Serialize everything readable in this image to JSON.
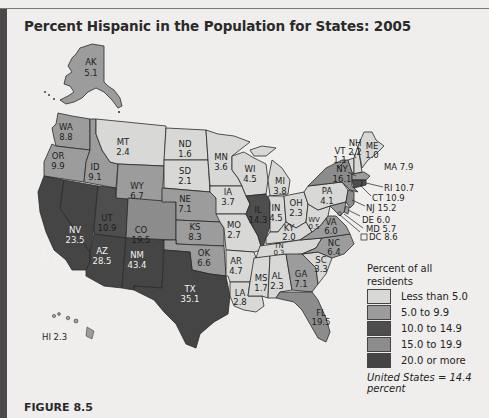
{
  "title": "Percent Hispanic in the Population for States: 2005",
  "figure_label": "FIGURE 8.5",
  "legend": {
    "title": "Percent of all residents",
    "items": [
      {
        "label": "Less than 5.0",
        "color": "#d8d8d6"
      },
      {
        "label": "5.0 to 9.9",
        "color": "#9c9c9c"
      },
      {
        "label": "10.0 to 14.9",
        "color": "#4e4e4e"
      },
      {
        "label": "15.0 to 19.9",
        "color": "#8c8c8c"
      },
      {
        "label": "20.0 or more",
        "color": "#454545"
      }
    ]
  },
  "us_note": "United States = 14.4 percent",
  "states": {
    "AK": {
      "abbr": "AK",
      "value": "5.1"
    },
    "HI": {
      "abbr": "HI",
      "value": "2.3",
      "label": "HI 2.3"
    },
    "WA": {
      "abbr": "WA",
      "value": "8.8"
    },
    "OR": {
      "abbr": "OR",
      "value": "9.9"
    },
    "CA": {
      "abbr": "CA",
      "value": "35.2"
    },
    "ID": {
      "abbr": "ID",
      "value": "9.1"
    },
    "NV": {
      "abbr": "NV",
      "value": "23.5"
    },
    "UT": {
      "abbr": "UT",
      "value": "10.9"
    },
    "AZ": {
      "abbr": "AZ",
      "value": "28.5"
    },
    "MT": {
      "abbr": "MT",
      "value": "2.4"
    },
    "WY": {
      "abbr": "WY",
      "value": "6.7"
    },
    "CO": {
      "abbr": "CO",
      "value": "19.5"
    },
    "NM": {
      "abbr": "NM",
      "value": "43.4"
    },
    "ND": {
      "abbr": "ND",
      "value": "1.6"
    },
    "SD": {
      "abbr": "SD",
      "value": "2.1"
    },
    "NE": {
      "abbr": "NE",
      "value": "7.1"
    },
    "KS": {
      "abbr": "KS",
      "value": "8.3"
    },
    "OK": {
      "abbr": "OK",
      "value": "6.6"
    },
    "TX": {
      "abbr": "TX",
      "value": "35.1"
    },
    "MN": {
      "abbr": "MN",
      "value": "3.6"
    },
    "IA": {
      "abbr": "IA",
      "value": "3.7"
    },
    "MO": {
      "abbr": "MO",
      "value": "2.7"
    },
    "AR": {
      "abbr": "AR",
      "value": "4.7"
    },
    "LA": {
      "abbr": "LA",
      "value": "2.8"
    },
    "WI": {
      "abbr": "WI",
      "value": "4.5"
    },
    "IL": {
      "abbr": "IL",
      "value": "14.3"
    },
    "MI": {
      "abbr": "MI",
      "value": "3.8"
    },
    "IN": {
      "abbr": "IN",
      "value": "4.5"
    },
    "OH": {
      "abbr": "OH",
      "value": "2.3"
    },
    "KY": {
      "abbr": "KY",
      "value": "2.0"
    },
    "TN": {
      "abbr": "TN",
      "value": "0.3"
    },
    "MS": {
      "abbr": "MS",
      "value": "1.7"
    },
    "AL": {
      "abbr": "AL",
      "value": "2.3"
    },
    "GA": {
      "abbr": "GA",
      "value": "7.1"
    },
    "FL": {
      "abbr": "FL",
      "value": "19.5"
    },
    "SC": {
      "abbr": "SC",
      "value": "3.3"
    },
    "NC": {
      "abbr": "NC",
      "value": "6.4"
    },
    "VA": {
      "abbr": "VA",
      "value": "6.0"
    },
    "WV": {
      "abbr": "WV",
      "value": "0.5"
    },
    "PA": {
      "abbr": "PA",
      "value": "4.1"
    },
    "NY": {
      "abbr": "NY",
      "value": "16.1"
    },
    "VT": {
      "abbr": "VT",
      "value": "1.1"
    },
    "NH": {
      "abbr": "NH",
      "value": "2.2"
    },
    "ME": {
      "abbr": "ME",
      "value": "1.0"
    },
    "MA": {
      "abbr": "MA",
      "value": "7.9",
      "label": "MA 7.9"
    },
    "RI": {
      "abbr": "RI",
      "value": "10.7",
      "label": "RI 10.7"
    },
    "CT": {
      "abbr": "CT",
      "value": "10.9",
      "label": "CT 10.9"
    },
    "NJ": {
      "abbr": "NJ",
      "value": "15.2",
      "label": "NJ 15.2"
    },
    "DE": {
      "abbr": "DE",
      "value": "6.0",
      "label": "DE 6.0"
    },
    "MD": {
      "abbr": "MD",
      "value": "5.7",
      "label": "MD 5.7"
    },
    "DC": {
      "abbr": "DC",
      "value": "8.6",
      "label": "DC 8.6"
    }
  }
}
